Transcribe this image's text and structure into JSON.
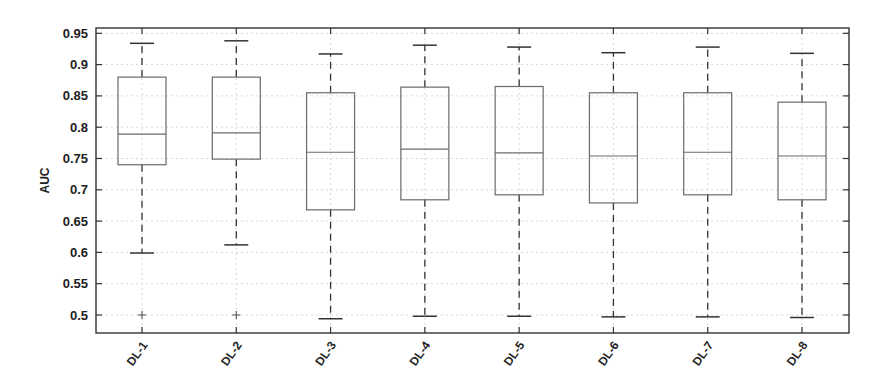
{
  "chart_data": {
    "type": "boxplot",
    "title": "",
    "xlabel": "",
    "ylabel": "AUC",
    "ylim": [
      0.47,
      0.96
    ],
    "yticks": [
      0.5,
      0.55,
      0.6,
      0.65,
      0.7,
      0.75,
      0.8,
      0.85,
      0.9,
      0.95
    ],
    "ytick_labels": [
      "0.5",
      "0.55",
      "0.6",
      "0.65",
      "0.7",
      "0.75",
      "0.8",
      "0.85",
      "0.9",
      "0.95"
    ],
    "grid": true,
    "legend": null,
    "categories": [
      "DL-1",
      "DL-2",
      "DL-3",
      "DL-4",
      "DL-5",
      "DL-6",
      "DL-7",
      "DL-8"
    ],
    "series": [
      {
        "name": "DL-1",
        "whisker_low": 0.599,
        "q1": 0.74,
        "median": 0.789,
        "q3": 0.88,
        "whisker_high": 0.934,
        "outliers": [
          0.5
        ]
      },
      {
        "name": "DL-2",
        "whisker_low": 0.612,
        "q1": 0.749,
        "median": 0.791,
        "q3": 0.88,
        "whisker_high": 0.938,
        "outliers": [
          0.5
        ]
      },
      {
        "name": "DL-3",
        "whisker_low": 0.494,
        "q1": 0.668,
        "median": 0.76,
        "q3": 0.855,
        "whisker_high": 0.917,
        "outliers": []
      },
      {
        "name": "DL-4",
        "whisker_low": 0.498,
        "q1": 0.684,
        "median": 0.765,
        "q3": 0.864,
        "whisker_high": 0.931,
        "outliers": []
      },
      {
        "name": "DL-5",
        "whisker_low": 0.498,
        "q1": 0.692,
        "median": 0.759,
        "q3": 0.865,
        "whisker_high": 0.928,
        "outliers": []
      },
      {
        "name": "DL-6",
        "whisker_low": 0.497,
        "q1": 0.679,
        "median": 0.754,
        "q3": 0.855,
        "whisker_high": 0.919,
        "outliers": []
      },
      {
        "name": "DL-7",
        "whisker_low": 0.497,
        "q1": 0.692,
        "median": 0.76,
        "q3": 0.855,
        "whisker_high": 0.928,
        "outliers": []
      },
      {
        "name": "DL-8",
        "whisker_low": 0.496,
        "q1": 0.684,
        "median": 0.754,
        "q3": 0.84,
        "whisker_high": 0.918,
        "outliers": []
      }
    ],
    "colors": {
      "box": "#6a6a6a",
      "whisker": "#333333",
      "axis": "#333333",
      "grid": "#d8d8d8",
      "text": "#222222"
    }
  }
}
